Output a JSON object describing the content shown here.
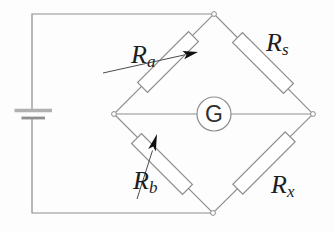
{
  "canvas": {
    "width": 335,
    "height": 232,
    "background": "#fdfdfd"
  },
  "circuit": {
    "kind": "wheatstone-bridge",
    "source": {
      "component": "battery"
    },
    "meter": {
      "component": "galvanometer",
      "label": "G"
    },
    "resistors": [
      {
        "name": "R_a",
        "main": "R",
        "sub": "a",
        "type": "variable",
        "position": "top-left-arm"
      },
      {
        "name": "R_s",
        "main": "R",
        "sub": "s",
        "type": "fixed",
        "position": "top-right-arm"
      },
      {
        "name": "R_b",
        "main": "R",
        "sub": "b",
        "type": "variable",
        "position": "bottom-left-arm"
      },
      {
        "name": "R_x",
        "main": "R",
        "sub": "x",
        "type": "fixed",
        "position": "bottom-right-arm"
      }
    ],
    "colors": {
      "wire": "#8d8d8d",
      "label": "#1d1d1d",
      "meter_text": "#2e2e2e",
      "arrow_line": "#4a4a4a",
      "arrowhead": "#101010",
      "battery_bar_long": "#b0b0b0",
      "battery_bar_short": "#8f8f8f",
      "node_fill": "#ffffff"
    }
  }
}
